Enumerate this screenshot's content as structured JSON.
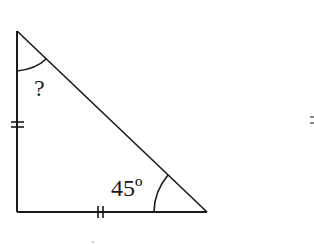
{
  "diagram": {
    "type": "right-isosceles-triangle",
    "vertices": {
      "top": [
        17,
        31
      ],
      "right_angle": [
        17,
        212
      ],
      "bottom_right": [
        207,
        212
      ]
    },
    "labels": {
      "top_angle": "?",
      "bottom_right_angle": "45º"
    },
    "equal_side_marks": [
      "left-vertical-side",
      "bottom-horizontal-side"
    ],
    "stray_mark": "="
  },
  "colors": {
    "stroke": "#1a1a1a",
    "background": "#ffffff"
  }
}
